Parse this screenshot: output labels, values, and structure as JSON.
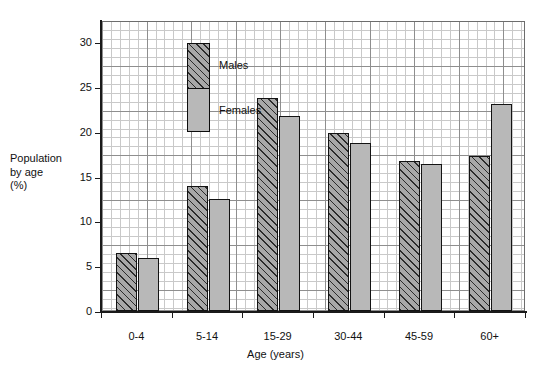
{
  "chart_data": {
    "type": "bar",
    "title": "",
    "subtitle": "",
    "xlabel": "Age (years)",
    "ylabel": "Population by age (%)",
    "ylabel_lines": [
      "Population",
      "by age",
      "(%)"
    ],
    "categories": [
      "0-4",
      "5-14",
      "15-29",
      "30-44",
      "45-59",
      "60+"
    ],
    "series": [
      {
        "name": "Males",
        "values": [
          6.5,
          14.0,
          23.8,
          19.9,
          16.7,
          17.3
        ]
      },
      {
        "name": "Females",
        "values": [
          5.9,
          12.5,
          21.7,
          18.7,
          16.4,
          23.1
        ]
      }
    ],
    "ylim": [
      0,
      32
    ],
    "yticks": [
      0,
      5,
      10,
      15,
      20,
      25,
      30
    ],
    "ytick_labels": [
      "0",
      "5",
      "10",
      "15",
      "20",
      "25",
      "30"
    ],
    "grid": true,
    "grid_style": "graph-paper-minor-and-major",
    "legend_position": "inside-upper-left",
    "legend": [
      {
        "name": "Males",
        "pattern": "diagonal-hatch",
        "color": "#a8a8a8"
      },
      {
        "name": "Females",
        "pattern": "solid-fill",
        "color": "#b8b8b8"
      }
    ]
  },
  "colors": {
    "male_fill": "#a8a8a8",
    "male_hatch": "#2b2b2b",
    "female_fill": "#b8b8b8",
    "bar_outline": "#131313",
    "grid_minor": "#c9c9c9",
    "grid_major": "#8e8e8e",
    "axis": "#1a1a1a",
    "text": "#111111",
    "background": "#ffffff"
  }
}
